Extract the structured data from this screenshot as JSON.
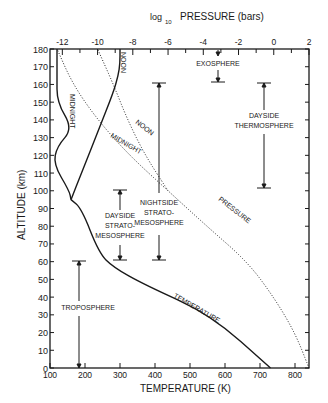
{
  "chart_data": {
    "type": "line",
    "title": "",
    "xlabel": "TEMPERATURE (K)",
    "x2label_main": "PRESSURE (bars)",
    "x2label_prefix": "log",
    "x2label_sub": "10",
    "ylabel": "ALTITUDE (km)",
    "xlim": [
      100,
      840
    ],
    "ylim": [
      0,
      180
    ],
    "x2lim": [
      -12.7,
      2
    ],
    "x_ticks": [
      "100",
      "200",
      "300",
      "400",
      "500",
      "600",
      "700",
      "800"
    ],
    "x2_ticks": [
      "-12",
      "-10",
      "-8",
      "-6",
      "-4",
      "-2",
      "0",
      "2"
    ],
    "y_ticks": [
      "0",
      "10",
      "20",
      "30",
      "40",
      "50",
      "60",
      "70",
      "80",
      "90",
      "100",
      "110",
      "120",
      "130",
      "140",
      "150",
      "160",
      "170",
      "180"
    ],
    "grid": false,
    "series": [
      {
        "name": "Temperature (lower atmosphere)",
        "axis": "temperature",
        "style": "solid",
        "points": [
          [
            730,
            0
          ],
          [
            560,
            30
          ],
          [
            370,
            47
          ],
          [
            280,
            57
          ],
          [
            240,
            65
          ],
          [
            190,
            90
          ],
          [
            160,
            95
          ]
        ]
      },
      {
        "name": "Temperature Midnight",
        "axis": "temperature",
        "style": "solid",
        "points": [
          [
            160,
            95
          ],
          [
            155,
            100
          ],
          [
            110,
            115
          ],
          [
            120,
            125
          ],
          [
            165,
            135
          ],
          [
            120,
            150
          ],
          [
            120,
            165
          ],
          [
            120,
            180
          ]
        ]
      },
      {
        "name": "Temperature Noon",
        "axis": "temperature",
        "style": "solid",
        "points": [
          [
            160,
            95
          ],
          [
            190,
            110
          ],
          [
            240,
            135
          ],
          [
            280,
            155
          ],
          [
            295,
            165
          ],
          [
            300,
            172
          ],
          [
            300,
            180
          ]
        ]
      },
      {
        "name": "Pressure",
        "axis": "pressure",
        "style": "dotted",
        "points": [
          [
            2,
            0
          ],
          [
            1.2,
            20
          ],
          [
            0,
            40
          ],
          [
            -1.5,
            60
          ],
          [
            -3.8,
            80
          ],
          [
            -6.0,
            100
          ]
        ]
      },
      {
        "name": "Pressure Noon",
        "axis": "pressure",
        "style": "dotted",
        "points": [
          [
            -6.0,
            100
          ],
          [
            -7.3,
            120
          ],
          [
            -8.3,
            140
          ],
          [
            -9.1,
            160
          ],
          [
            -10.0,
            180
          ]
        ]
      },
      {
        "name": "Pressure Midnight",
        "axis": "pressure",
        "style": "dotted",
        "points": [
          [
            -6.0,
            100
          ],
          [
            -8.2,
            120
          ],
          [
            -10.0,
            140
          ],
          [
            -11.4,
            160
          ],
          [
            -12.3,
            180
          ]
        ]
      }
    ],
    "annotations": [
      {
        "text": "NOON",
        "note": "vertical label on noon temperature curve near top"
      },
      {
        "text": "MIDNIGHT",
        "note": "vertical label on midnight temperature curve"
      },
      {
        "text": "NOON",
        "note": "label on noon pressure curve"
      },
      {
        "text": "MIDNIGHT",
        "note": "label on midnight pressure curve"
      },
      {
        "text": "PRESSURE",
        "note": "label on pressure curve"
      },
      {
        "text": "TEMPERATURE",
        "note": "label on temperature curve"
      },
      {
        "text": "EXOSPHERE",
        "range_km": [
          160,
          180
        ]
      },
      {
        "text": "DAYSIDE THERMOSPHERE",
        "range_km": [
          100,
          160
        ]
      },
      {
        "text": "NIGHTSIDE STRATO-MESOSPHERE",
        "range_km": [
          60,
          160
        ]
      },
      {
        "text": "DAYSIDE STRATO-MESOSPHERE",
        "range_km": [
          60,
          100
        ]
      },
      {
        "text": "TROPOSPHERE",
        "range_km": [
          0,
          60
        ]
      }
    ]
  },
  "labels": {
    "exosphere": "EXOSPHERE",
    "dayside_thermo_1": "DAYSIDE",
    "dayside_thermo_2": "THERMOSPHERE",
    "nightside_1": "NIGHTSIDE",
    "nightside_2": "STRATO-",
    "nightside_3": "MESOSPHERE",
    "dayside_strato_1": "DAYSIDE",
    "dayside_strato_2": "STRATO-",
    "dayside_strato_3": "MESOSPHERE",
    "troposphere": "TROPOSPHERE",
    "temperature_curve": "TEMPERATURE",
    "pressure_curve": "PRESSURE",
    "noon_p": "NOON",
    "midnight_p": "MIDNIGHT",
    "noon_t": "NOON",
    "midnight_t": "MIDNIGHT"
  }
}
